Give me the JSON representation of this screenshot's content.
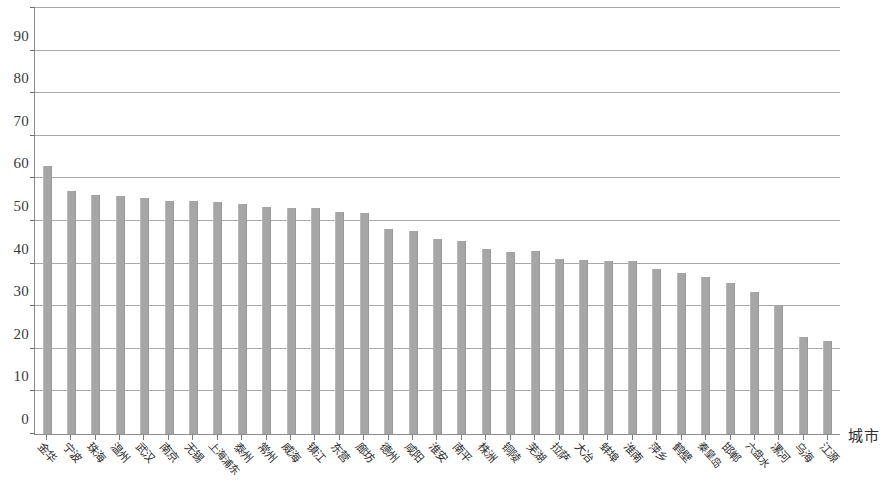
{
  "chart_data": {
    "type": "bar",
    "title": "",
    "subtitle": "",
    "xlabel": "城市",
    "ylabel": "",
    "ylim": [
      0,
      100
    ],
    "yticks": [
      0,
      10,
      20,
      30,
      40,
      50,
      60,
      70,
      80,
      90,
      100
    ],
    "ytick_labels": [
      "0",
      "10",
      "20",
      "30",
      "40",
      "50",
      "60",
      "70",
      "80",
      "90",
      "100"
    ],
    "grid": true,
    "legend": false,
    "legend_position": "none",
    "bar_color": "#a6a6a6",
    "axis_color": "#8c8c8c",
    "grid_color": "#a9a9a9",
    "categories": [
      "金华",
      "宁波",
      "珠海",
      "温州",
      "武汉",
      "南京",
      "无锡",
      "上海浦东",
      "泰州",
      "常州",
      "威海",
      "镇江",
      "东营",
      "廊坊",
      "德州",
      "咸阳",
      "淮安",
      "南平",
      "株洲",
      "铜陵",
      "芜湖",
      "拉萨",
      "大冶",
      "蚌埠",
      "淮南",
      "萍乡",
      "鹤壁",
      "秦皇岛",
      "邯郸",
      "六盘水",
      "漯河",
      "乌海",
      "江源"
    ],
    "values": [
      62.8,
      57.0,
      56.0,
      55.8,
      55.3,
      54.8,
      54.6,
      54.5,
      54.0,
      53.2,
      53.0,
      53.0,
      52.0,
      51.8,
      48.2,
      47.6,
      45.7,
      45.3,
      43.5,
      42.8,
      43.0,
      41.0,
      40.8,
      40.7,
      40.6,
      38.8,
      37.8,
      36.8,
      35.5,
      33.3,
      30.3,
      22.8,
      21.9
    ]
  }
}
